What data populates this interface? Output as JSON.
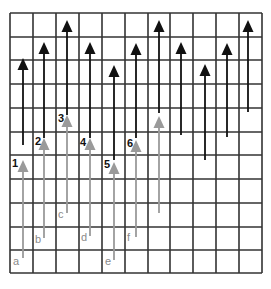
{
  "figure": {
    "width": 271,
    "height": 289,
    "grid": {
      "rows": 11,
      "cols": 11,
      "x_lines": [
        10,
        33,
        56,
        79,
        102,
        125,
        148,
        170,
        193,
        216,
        239,
        262
      ],
      "y_lines": [
        13,
        37,
        60,
        84,
        108,
        132,
        155,
        179,
        203,
        227,
        250,
        273
      ],
      "color": "#333333"
    },
    "colors": {
      "black_arrow": "#111111",
      "gray_arrow": "#9a9a9a",
      "number_label": "#111111",
      "letter_label": "#8a8a8a"
    },
    "black_arrows": [
      {
        "x": 23,
        "tip": 58,
        "tail": 145,
        "label": "1",
        "label_x": 12,
        "label_y": 167
      },
      {
        "x": 44,
        "tip": 42,
        "tail": 138,
        "label": "2",
        "label_x": 35,
        "label_y": 145
      },
      {
        "x": 67,
        "tip": 20,
        "tail": 115,
        "label": "3",
        "label_x": 58,
        "label_y": 122
      },
      {
        "x": 90,
        "tip": 42,
        "tail": 138,
        "label": "4",
        "label_x": 80,
        "label_y": 146
      },
      {
        "x": 114,
        "tip": 65,
        "tail": 160,
        "label": "5",
        "label_x": 104,
        "label_y": 168
      },
      {
        "x": 136,
        "tip": 43,
        "tail": 138,
        "label": "6",
        "label_x": 127,
        "label_y": 147
      },
      {
        "x": 159,
        "tip": 20,
        "tail": 113,
        "label": "",
        "label_x": 0,
        "label_y": 0
      },
      {
        "x": 181,
        "tip": 42,
        "tail": 135,
        "label": "",
        "label_x": 0,
        "label_y": 0
      },
      {
        "x": 205,
        "tip": 64,
        "tail": 160,
        "label": "",
        "label_x": 0,
        "label_y": 0
      },
      {
        "x": 227,
        "tip": 43,
        "tail": 137,
        "label": "",
        "label_x": 0,
        "label_y": 0
      },
      {
        "x": 248,
        "tip": 20,
        "tail": 112,
        "label": "",
        "label_x": 0,
        "label_y": 0
      }
    ],
    "gray_arrows": [
      {
        "x": 23,
        "tip": 160,
        "tail": 258,
        "label": "a",
        "label_x": 13,
        "label_y": 265
      },
      {
        "x": 44,
        "tip": 138,
        "tail": 238,
        "label": "b",
        "label_x": 35,
        "label_y": 243
      },
      {
        "x": 67,
        "tip": 115,
        "tail": 213,
        "label": "c",
        "label_x": 58,
        "label_y": 218
      },
      {
        "x": 90,
        "tip": 138,
        "tail": 236,
        "label": "d",
        "label_x": 81,
        "label_y": 241
      },
      {
        "x": 114,
        "tip": 162,
        "tail": 260,
        "label": "e",
        "label_x": 105,
        "label_y": 265
      },
      {
        "x": 136,
        "tip": 140,
        "tail": 237,
        "label": "f",
        "label_x": 127,
        "label_y": 241
      },
      {
        "x": 159,
        "tip": 116,
        "tail": 213,
        "label": "",
        "label_x": 0,
        "label_y": 0
      }
    ]
  }
}
